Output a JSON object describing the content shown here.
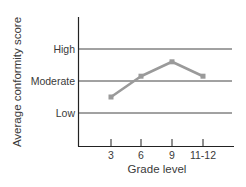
{
  "chart_data": {
    "type": "line",
    "title": "",
    "xlabel": "Grade level",
    "ylabel": "Average conformity score",
    "categories": [
      "3",
      "6",
      "9",
      "11-12"
    ],
    "y_tick_labels": [
      "Low",
      "Moderate",
      "High"
    ],
    "y_tick_values": [
      1,
      2,
      3
    ],
    "ylim": [
      0,
      4
    ],
    "grid": true,
    "legend": null,
    "series": [
      {
        "name": "Average conformity score",
        "values": [
          1.5,
          2.15,
          2.6,
          2.15
        ],
        "color": "#9a9a9a"
      }
    ]
  },
  "colors": {
    "axis": "#222222",
    "gridline": "#444444",
    "series_line": "#9a9a9a",
    "text": "#3a3a3a"
  }
}
